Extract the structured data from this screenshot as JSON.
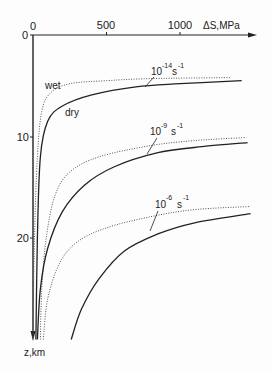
{
  "chart_data": {
    "type": "line",
    "title": "",
    "xlabel": "ΔS, MPa",
    "ylabel": "z, km",
    "x_ticks": [
      0,
      500,
      1000
    ],
    "y_ticks": [
      0,
      10,
      20
    ],
    "xlim": [
      0,
      1500
    ],
    "ylim": [
      0,
      30
    ],
    "y_inverted": true,
    "grid": false,
    "legend": null,
    "annotations": [
      {
        "text": "wet",
        "near": "dotted curve 10^-14 s^-1"
      },
      {
        "text": "dry",
        "near": "solid curve 10^-14 s^-1"
      },
      {
        "text": "10^-14 s^-1",
        "base": "10",
        "exp": "-14",
        "unit": "s",
        "unit_exp": "-1"
      },
      {
        "text": "10^-9 s^-1",
        "base": "10",
        "exp": "-9",
        "unit": "s",
        "unit_exp": "-1"
      },
      {
        "text": "10^-6 s^-1",
        "base": "10",
        "exp": "-6",
        "unit": "s",
        "unit_exp": "-1"
      }
    ],
    "series": [
      {
        "name": "wet, 10^-14 s^-1",
        "style": "dotted",
        "points": [
          [
            0,
            30
          ],
          [
            10,
            20
          ],
          [
            30,
            12
          ],
          [
            60,
            7.5
          ],
          [
            120,
            5.7
          ],
          [
            250,
            4.8
          ],
          [
            500,
            4.5
          ],
          [
            800,
            4.3
          ],
          [
            1340,
            4.2
          ]
        ]
      },
      {
        "name": "dry, 10^-14 s^-1",
        "style": "solid",
        "points": [
          [
            20,
            30
          ],
          [
            30,
            20
          ],
          [
            50,
            12
          ],
          [
            100,
            8.5
          ],
          [
            200,
            7
          ],
          [
            400,
            5.9
          ],
          [
            700,
            5.1
          ],
          [
            1000,
            4.8
          ],
          [
            1420,
            4.5
          ]
        ]
      },
      {
        "name": "wet, 10^-9 s^-1",
        "style": "dotted",
        "points": [
          [
            50,
            30
          ],
          [
            60,
            25
          ],
          [
            90,
            20
          ],
          [
            150,
            15.8
          ],
          [
            250,
            13.5
          ],
          [
            450,
            12
          ],
          [
            800,
            10.9
          ],
          [
            1100,
            10.4
          ],
          [
            1450,
            10.1
          ]
        ]
      },
      {
        "name": "dry, 10^-9 s^-1",
        "style": "solid",
        "points": [
          [
            30,
            30
          ],
          [
            50,
            25
          ],
          [
            100,
            21
          ],
          [
            200,
            17.4
          ],
          [
            350,
            14.8
          ],
          [
            550,
            13
          ],
          [
            850,
            11.6
          ],
          [
            1150,
            11
          ],
          [
            1460,
            10.6
          ]
        ]
      },
      {
        "name": "wet, 10^-6 s^-1",
        "style": "dotted",
        "points": [
          [
            70,
            30
          ],
          [
            100,
            26
          ],
          [
            180,
            22.5
          ],
          [
            300,
            20.4
          ],
          [
            500,
            19
          ],
          [
            800,
            17.9
          ],
          [
            1100,
            17.2
          ],
          [
            1480,
            16.9
          ]
        ]
      },
      {
        "name": "dry, 10^-6 s^-1",
        "style": "solid",
        "points": [
          [
            260,
            30
          ],
          [
            330,
            27
          ],
          [
            450,
            24
          ],
          [
            620,
            21.3
          ],
          [
            850,
            19.6
          ],
          [
            1100,
            18.5
          ],
          [
            1480,
            17.6
          ]
        ]
      }
    ]
  },
  "labels": {
    "x_axis": "ΔS,MPa",
    "y_axis": "z,km",
    "x_tick_0": "0",
    "x_tick_500": "500",
    "x_tick_1000": "1000",
    "y_tick_0": "0",
    "y_tick_10": "10",
    "y_tick_20": "20",
    "wet": "wet",
    "dry": "dry",
    "rate1_base": "10",
    "rate1_exp": "-14",
    "rate2_base": "10",
    "rate2_exp": "-9",
    "rate3_base": "10",
    "rate3_exp": "-6",
    "unit": "s",
    "unit_exp": "-1"
  }
}
